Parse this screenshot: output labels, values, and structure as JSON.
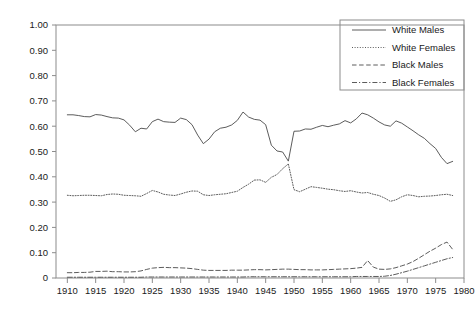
{
  "chart_data": {
    "type": "line",
    "title": "",
    "subtitle": "",
    "xlabel": "",
    "ylabel": "",
    "xlim": [
      1908,
      1980
    ],
    "ylim": [
      0,
      1.0
    ],
    "grid": false,
    "legend_position": "top-right",
    "x_tick_labels": [
      "1910",
      "1915",
      "1920",
      "1925",
      "1930",
      "1935",
      "1940",
      "1945",
      "1950",
      "1955",
      "1960",
      "1965",
      "1970",
      "1975",
      "1980"
    ],
    "x_ticks": [
      1910,
      1915,
      1920,
      1925,
      1930,
      1935,
      1940,
      1945,
      1950,
      1955,
      1960,
      1965,
      1970,
      1975,
      1980
    ],
    "y_tick_labels": [
      "0",
      "0.10",
      "0.20",
      "0.30",
      "0.40",
      "0.50",
      "0.60",
      "0.70",
      "0.80",
      "0.90",
      "1.00"
    ],
    "y_ticks": [
      0,
      0.1,
      0.2,
      0.3,
      0.4,
      0.5,
      0.6,
      0.7,
      0.8,
      0.9,
      1.0
    ],
    "x": [
      1910,
      1911,
      1912,
      1913,
      1914,
      1915,
      1916,
      1917,
      1918,
      1919,
      1920,
      1921,
      1922,
      1923,
      1924,
      1925,
      1926,
      1927,
      1928,
      1929,
      1930,
      1931,
      1932,
      1933,
      1934,
      1935,
      1936,
      1937,
      1938,
      1939,
      1940,
      1941,
      1942,
      1943,
      1944,
      1945,
      1946,
      1947,
      1948,
      1949,
      1950,
      1951,
      1952,
      1953,
      1954,
      1955,
      1956,
      1957,
      1958,
      1959,
      1960,
      1961,
      1962,
      1963,
      1964,
      1965,
      1966,
      1967,
      1968,
      1969,
      1970,
      1971,
      1972,
      1973,
      1974,
      1975,
      1976,
      1977,
      1978
    ],
    "series": [
      {
        "name": "White Males",
        "style": "solid",
        "color": "#4a4a4a",
        "values": [
          0.645,
          0.645,
          0.642,
          0.638,
          0.637,
          0.646,
          0.644,
          0.638,
          0.633,
          0.632,
          0.625,
          0.604,
          0.578,
          0.592,
          0.589,
          0.618,
          0.628,
          0.618,
          0.616,
          0.615,
          0.632,
          0.626,
          0.606,
          0.565,
          0.531,
          0.549,
          0.578,
          0.592,
          0.596,
          0.605,
          0.623,
          0.656,
          0.636,
          0.627,
          0.624,
          0.606,
          0.525,
          0.502,
          0.498,
          0.462,
          0.58,
          0.581,
          0.589,
          0.588,
          0.596,
          0.603,
          0.598,
          0.604,
          0.609,
          0.622,
          0.613,
          0.629,
          0.652,
          0.645,
          0.632,
          0.617,
          0.605,
          0.6,
          0.621,
          0.612,
          0.597,
          0.582,
          0.566,
          0.552,
          0.531,
          0.512,
          0.477,
          0.452,
          0.461
        ]
      },
      {
        "name": "White Females",
        "style": "dotted",
        "color": "#4a4a4a",
        "values": [
          0.327,
          0.325,
          0.326,
          0.327,
          0.327,
          0.326,
          0.325,
          0.33,
          0.332,
          0.331,
          0.327,
          0.326,
          0.325,
          0.323,
          0.334,
          0.346,
          0.34,
          0.331,
          0.328,
          0.326,
          0.332,
          0.339,
          0.344,
          0.343,
          0.329,
          0.326,
          0.329,
          0.331,
          0.333,
          0.338,
          0.343,
          0.358,
          0.371,
          0.387,
          0.388,
          0.378,
          0.398,
          0.409,
          0.432,
          0.451,
          0.349,
          0.341,
          0.351,
          0.361,
          0.358,
          0.355,
          0.351,
          0.349,
          0.345,
          0.342,
          0.345,
          0.34,
          0.336,
          0.338,
          0.331,
          0.326,
          0.316,
          0.303,
          0.309,
          0.321,
          0.329,
          0.326,
          0.321,
          0.323,
          0.324,
          0.326,
          0.329,
          0.331,
          0.326
        ]
      },
      {
        "name": "Black Males",
        "style": "dashed",
        "color": "#4a4a4a",
        "values": [
          0.021,
          0.021,
          0.022,
          0.022,
          0.023,
          0.026,
          0.026,
          0.027,
          0.025,
          0.025,
          0.024,
          0.024,
          0.025,
          0.028,
          0.034,
          0.039,
          0.041,
          0.042,
          0.041,
          0.041,
          0.04,
          0.039,
          0.037,
          0.034,
          0.031,
          0.03,
          0.03,
          0.03,
          0.03,
          0.031,
          0.031,
          0.031,
          0.032,
          0.033,
          0.033,
          0.032,
          0.033,
          0.034,
          0.035,
          0.035,
          0.034,
          0.033,
          0.033,
          0.032,
          0.032,
          0.032,
          0.033,
          0.034,
          0.035,
          0.036,
          0.037,
          0.039,
          0.042,
          0.069,
          0.043,
          0.035,
          0.034,
          0.036,
          0.041,
          0.048,
          0.055,
          0.065,
          0.078,
          0.092,
          0.106,
          0.118,
          0.132,
          0.142,
          0.113
        ]
      },
      {
        "name": "Black Females",
        "style": "dashdot",
        "color": "#4a4a4a",
        "values": [
          0.003,
          0.003,
          0.003,
          0.003,
          0.003,
          0.003,
          0.003,
          0.003,
          0.003,
          0.003,
          0.003,
          0.003,
          0.003,
          0.003,
          0.004,
          0.004,
          0.004,
          0.004,
          0.004,
          0.004,
          0.004,
          0.004,
          0.004,
          0.004,
          0.004,
          0.004,
          0.004,
          0.004,
          0.004,
          0.004,
          0.004,
          0.004,
          0.005,
          0.005,
          0.005,
          0.005,
          0.005,
          0.005,
          0.005,
          0.005,
          0.005,
          0.005,
          0.005,
          0.005,
          0.005,
          0.005,
          0.005,
          0.005,
          0.005,
          0.005,
          0.005,
          0.006,
          0.006,
          0.006,
          0.006,
          0.006,
          0.007,
          0.01,
          0.015,
          0.021,
          0.027,
          0.034,
          0.041,
          0.048,
          0.055,
          0.062,
          0.069,
          0.076,
          0.081
        ]
      }
    ]
  },
  "legend": {
    "entries": [
      {
        "label": "White Males",
        "style": "solid"
      },
      {
        "label": "White Females",
        "style": "dotted"
      },
      {
        "label": "Black Males",
        "style": "dashed"
      },
      {
        "label": "Black Females",
        "style": "dashdot"
      }
    ]
  }
}
